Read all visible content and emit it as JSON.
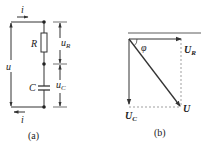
{
  "figure_a": {
    "caption": "(a)",
    "current_top": "i",
    "current_bottom": "i",
    "source_voltage": "u",
    "resistor_label": "R",
    "capacitor_label": "C",
    "resistor_voltage": {
      "main": "u",
      "sub": "R"
    },
    "capacitor_voltage": {
      "main": "u",
      "sub": "C"
    }
  },
  "figure_b": {
    "caption": "(b)",
    "angle_label": "φ",
    "phasor_UR": {
      "main": "U",
      "sub": "R"
    },
    "phasor_UC": {
      "main": "U",
      "sub": "C"
    },
    "phasor_U": "U"
  },
  "colors": {
    "line": "#333333",
    "dashed": "#777777",
    "text": "#222222"
  }
}
